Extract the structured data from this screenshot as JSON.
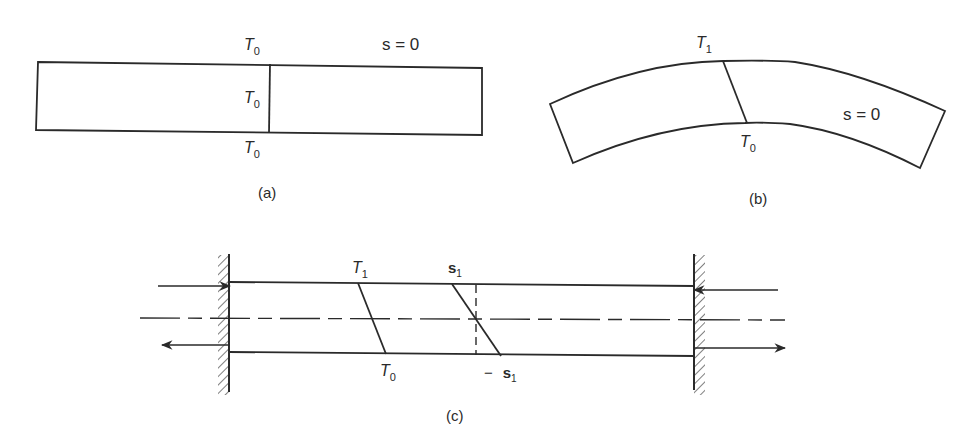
{
  "figure": {
    "panels": [
      {
        "id": "a",
        "caption": "(a)",
        "labels": {
          "top_T": "T",
          "top_T_sub": "0",
          "mid_T": "T",
          "mid_T_sub": "0",
          "bot_T": "T",
          "bot_T_sub": "0",
          "stress": "s = 0"
        }
      },
      {
        "id": "b",
        "caption": "(b)",
        "labels": {
          "top_T": "T",
          "top_T_sub": "1",
          "bot_T": "T",
          "bot_T_sub": "0",
          "stress": "s = 0"
        }
      },
      {
        "id": "c",
        "caption": "(c)",
        "labels": {
          "top_T": "T",
          "top_T_sub": "1",
          "bot_T": "T",
          "bot_T_sub": "0",
          "top_s": "s",
          "top_s_sub": "1",
          "bot_s_prefix": "−",
          "bot_s": "s",
          "bot_s_sub": "1"
        }
      }
    ],
    "colors": {
      "ink": "#2a2a2a",
      "background": "#ffffff"
    }
  }
}
